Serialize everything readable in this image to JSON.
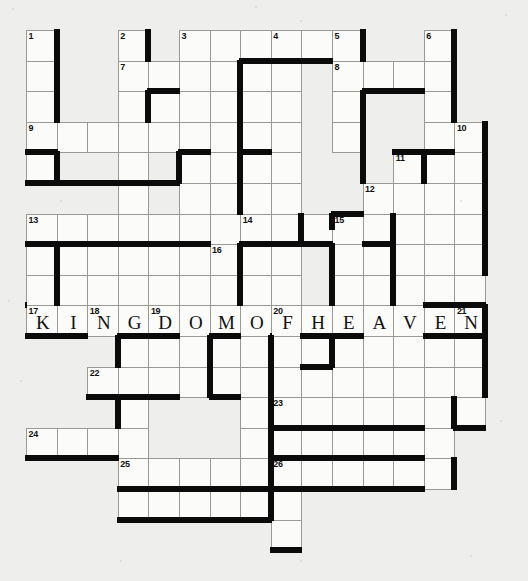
{
  "puzzle": {
    "title": "Crossword fill-in grid",
    "type": "fill-in-crossword",
    "grid_columns": 15,
    "grid_rows": 17,
    "cell_size": 30.6,
    "origin_x": 26,
    "origin_y": 30,
    "colors": {
      "page_background": "#eeeeec",
      "cell_fill": "#fbfbf9",
      "cell_border": "#9a9a95",
      "bar_color": "#0b0b0b",
      "text_color": "#111111"
    },
    "filled_answer": "KINGDOMOFHEAVEN",
    "clue_numbers": [
      1,
      2,
      3,
      4,
      5,
      6,
      7,
      8,
      9,
      10,
      11,
      12,
      13,
      14,
      15,
      16,
      17,
      18,
      19,
      20,
      21,
      22,
      23,
      24,
      25,
      26
    ],
    "cells": [
      {
        "n": "1",
        "c": 0,
        "r": 0,
        "letter": ""
      },
      {
        "n": "",
        "c": 0,
        "r": 1,
        "letter": ""
      },
      {
        "n": "",
        "c": 0,
        "r": 2,
        "letter": ""
      },
      {
        "n": "9",
        "c": 0,
        "r": 3,
        "letter": ""
      },
      {
        "n": "",
        "c": 1,
        "r": 3,
        "letter": ""
      },
      {
        "n": "",
        "c": 2,
        "r": 3,
        "letter": ""
      },
      {
        "n": "",
        "c": 3,
        "r": 3,
        "letter": ""
      },
      {
        "n": "",
        "c": 4,
        "r": 3,
        "letter": ""
      },
      {
        "n": "",
        "c": 5,
        "r": 3,
        "letter": ""
      },
      {
        "n": "",
        "c": 6,
        "r": 3,
        "letter": ""
      },
      {
        "n": "",
        "c": 0,
        "r": 4,
        "letter": ""
      },
      {
        "n": "",
        "c": 3,
        "r": 4,
        "letter": ""
      },
      {
        "n": "",
        "c": 5,
        "r": 4,
        "letter": ""
      },
      {
        "n": "2",
        "c": 3,
        "r": 0,
        "letter": ""
      },
      {
        "n": "7",
        "c": 3,
        "r": 1,
        "letter": ""
      },
      {
        "n": "",
        "c": 4,
        "r": 1,
        "letter": ""
      },
      {
        "n": "",
        "c": 3,
        "r": 2,
        "letter": ""
      },
      {
        "n": "",
        "c": 4,
        "r": 2,
        "letter": ""
      },
      {
        "n": "3",
        "c": 5,
        "r": 0,
        "letter": ""
      },
      {
        "n": "",
        "c": 6,
        "r": 0,
        "letter": ""
      },
      {
        "n": "",
        "c": 7,
        "r": 0,
        "letter": ""
      },
      {
        "n": "4",
        "c": 8,
        "r": 0,
        "letter": ""
      },
      {
        "n": "",
        "c": 9,
        "r": 0,
        "letter": ""
      },
      {
        "n": "5",
        "c": 10,
        "r": 0,
        "letter": ""
      },
      {
        "n": "6",
        "c": 13,
        "r": 0,
        "letter": ""
      },
      {
        "n": "",
        "c": 5,
        "r": 1,
        "letter": ""
      },
      {
        "n": "",
        "c": 6,
        "r": 1,
        "letter": ""
      },
      {
        "n": "",
        "c": 8,
        "r": 1,
        "letter": ""
      },
      {
        "n": "8",
        "c": 10,
        "r": 1,
        "letter": ""
      },
      {
        "n": "",
        "c": 11,
        "r": 1,
        "letter": ""
      },
      {
        "n": "",
        "c": 12,
        "r": 1,
        "letter": ""
      },
      {
        "n": "",
        "c": 13,
        "r": 1,
        "letter": ""
      },
      {
        "n": "",
        "c": 5,
        "r": 2,
        "letter": ""
      },
      {
        "n": "",
        "c": 6,
        "r": 2,
        "letter": ""
      },
      {
        "n": "",
        "c": 8,
        "r": 2,
        "letter": ""
      },
      {
        "n": "",
        "c": 10,
        "r": 2,
        "letter": ""
      },
      {
        "n": "",
        "c": 13,
        "r": 2,
        "letter": ""
      },
      {
        "n": "",
        "c": 8,
        "r": 3,
        "letter": ""
      },
      {
        "n": "",
        "c": 10,
        "r": 3,
        "letter": ""
      },
      {
        "n": "",
        "c": 13,
        "r": 3,
        "letter": ""
      },
      {
        "n": "10",
        "c": 14,
        "r": 3,
        "letter": ""
      },
      {
        "n": "",
        "c": 5,
        "r": 5,
        "letter": ""
      },
      {
        "n": "",
        "c": 8,
        "r": 4,
        "letter": ""
      },
      {
        "n": "",
        "c": 8,
        "r": 5,
        "letter": ""
      },
      {
        "n": "",
        "c": 8,
        "r": 6,
        "letter": ""
      },
      {
        "n": "11",
        "c": 12,
        "r": 4,
        "letter": ""
      },
      {
        "n": "",
        "c": 14,
        "r": 4,
        "letter": ""
      },
      {
        "n": "12",
        "c": 11,
        "r": 5,
        "letter": ""
      },
      {
        "n": "",
        "c": 12,
        "r": 5,
        "letter": ""
      },
      {
        "n": "",
        "c": 13,
        "r": 5,
        "letter": ""
      },
      {
        "n": "",
        "c": 14,
        "r": 5,
        "letter": ""
      },
      {
        "n": "13",
        "c": 0,
        "r": 6,
        "letter": ""
      },
      {
        "n": "",
        "c": 1,
        "r": 6,
        "letter": ""
      },
      {
        "n": "",
        "c": 2,
        "r": 6,
        "letter": ""
      },
      {
        "n": "",
        "c": 3,
        "r": 6,
        "letter": ""
      },
      {
        "n": "",
        "c": 4,
        "r": 6,
        "letter": ""
      },
      {
        "n": "",
        "c": 5,
        "r": 6,
        "letter": ""
      },
      {
        "n": "",
        "c": 6,
        "r": 6,
        "letter": ""
      },
      {
        "n": "14",
        "c": 7,
        "r": 6,
        "letter": ""
      },
      {
        "n": "",
        "c": 8,
        "r": 6,
        "letter": ""
      },
      {
        "n": "15",
        "c": 10,
        "r": 6,
        "letter": ""
      },
      {
        "n": "16",
        "c": 6,
        "r": 7,
        "letter": ""
      },
      {
        "n": "17",
        "c": 0,
        "r": 9,
        "letter": "K"
      },
      {
        "n": "",
        "c": 1,
        "r": 9,
        "letter": "I"
      },
      {
        "n": "18",
        "c": 2,
        "r": 9,
        "letter": "N"
      },
      {
        "n": "",
        "c": 3,
        "r": 9,
        "letter": "G"
      },
      {
        "n": "19",
        "c": 4,
        "r": 9,
        "letter": "D"
      },
      {
        "n": "",
        "c": 5,
        "r": 9,
        "letter": "O"
      },
      {
        "n": "",
        "c": 6,
        "r": 9,
        "letter": "M"
      },
      {
        "n": "",
        "c": 7,
        "r": 9,
        "letter": "O"
      },
      {
        "n": "20",
        "c": 8,
        "r": 9,
        "letter": "F"
      },
      {
        "n": "",
        "c": 9,
        "r": 9,
        "letter": "H"
      },
      {
        "n": "",
        "c": 10,
        "r": 9,
        "letter": "E"
      },
      {
        "n": "",
        "c": 11,
        "r": 9,
        "letter": "A"
      },
      {
        "n": "",
        "c": 12,
        "r": 9,
        "letter": "V"
      },
      {
        "n": "",
        "c": 13,
        "r": 9,
        "letter": "E"
      },
      {
        "n": "21",
        "c": 14,
        "r": 9,
        "letter": "N"
      },
      {
        "n": "22",
        "c": 2,
        "r": 11,
        "letter": ""
      },
      {
        "n": "23",
        "c": 8,
        "r": 12,
        "letter": ""
      },
      {
        "n": "24",
        "c": 0,
        "r": 13,
        "letter": ""
      },
      {
        "n": "25",
        "c": 3,
        "r": 14,
        "letter": ""
      },
      {
        "n": "26",
        "c": 8,
        "r": 14,
        "letter": ""
      }
    ]
  }
}
